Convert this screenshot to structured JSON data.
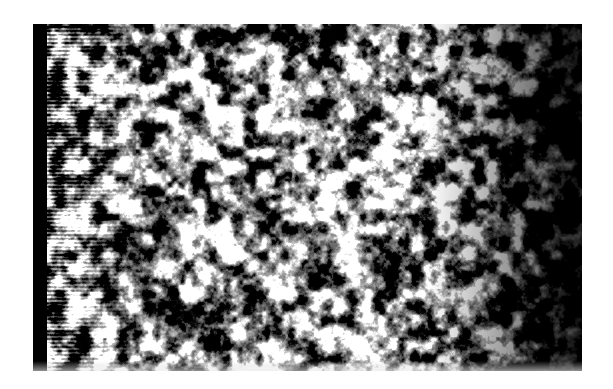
{
  "page": {
    "width": 613,
    "height": 389,
    "background_color": "#ffffff",
    "content_type": "grayscale-photographic-plate",
    "has_text": false,
    "has_axes": false,
    "has_caption": false
  },
  "plate": {
    "name": "grayscale-micrograph-plate",
    "x": 33,
    "y": 24,
    "width": 549,
    "height": 347,
    "description": "High-contrast black-and-white mottled speckle texture, resembling a scanned halftone micrograph or noise field",
    "base_color": "#050505",
    "highlight_color": "#e8e8e8",
    "midtone_color": "#8a8a8a",
    "shadow_color": "#000000"
  },
  "features": {
    "left_bar": {
      "name": "black-left-edge-bar",
      "x": 0,
      "width": 14,
      "color": "#000000"
    },
    "scanline_band": {
      "name": "horizontal-scanline-band",
      "x": 14,
      "width": 96,
      "description": "Strong horizontal striping / scan-line artifact over the left fifth of the plate",
      "line_spacing_px": 4,
      "strength": 0.85
    },
    "bright_blob": {
      "name": "bright-blob-highlight",
      "cx": 92,
      "cy": 173,
      "radius": 22,
      "color": "#d8d8d8"
    },
    "right_darkening": {
      "name": "right-edge-darkening",
      "start_fraction": 0.72,
      "description": "Texture progressively darkens toward the right edge, nearly solid black at the far right",
      "color": "#000000"
    },
    "bottom_fringe": {
      "name": "bottom-light-fringe",
      "height": 10,
      "color": "#e8e8e8"
    }
  },
  "texture_params": {
    "type": "fractal-value-noise",
    "octaves": 5,
    "base_cell_px": 13,
    "contrast_gain": 3.4,
    "threshold": 0.5,
    "seed": 20250614
  }
}
